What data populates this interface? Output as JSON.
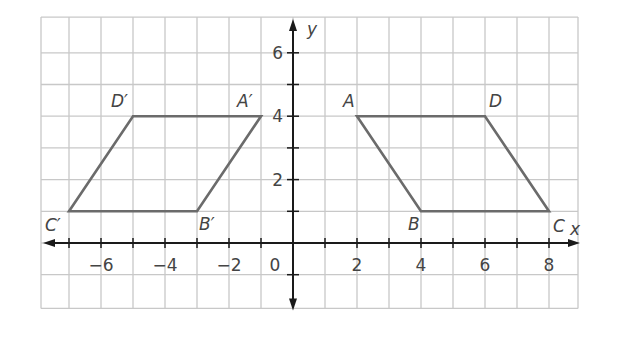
{
  "diagram": {
    "type": "coordinate-plane-reflection",
    "axes": {
      "x_label": "x",
      "y_label": "y",
      "origin_label": "0",
      "x_ticks": [
        "−6",
        "−4",
        "−2",
        "2",
        "4",
        "6",
        "8"
      ],
      "y_ticks": [
        "2",
        "4",
        "6"
      ]
    },
    "figures": [
      {
        "name": "ABCD",
        "points": [
          {
            "label": "A",
            "x": 2,
            "y": 4
          },
          {
            "label": "B",
            "x": 4,
            "y": 1
          },
          {
            "label": "C",
            "x": 8,
            "y": 1
          },
          {
            "label": "D",
            "x": 6,
            "y": 4
          }
        ]
      },
      {
        "name": "A'B'C'D'",
        "points": [
          {
            "label": "A′",
            "x": -1,
            "y": 4
          },
          {
            "label": "B′",
            "x": -3,
            "y": 1
          },
          {
            "label": "C′",
            "x": -7,
            "y": 1
          },
          {
            "label": "D′",
            "x": -5,
            "y": 4
          }
        ]
      }
    ],
    "colors": {
      "grid": "#c8c8c8",
      "axis": "#1a1a1a",
      "shape": "#6b6b6b",
      "text": "#444444"
    }
  }
}
